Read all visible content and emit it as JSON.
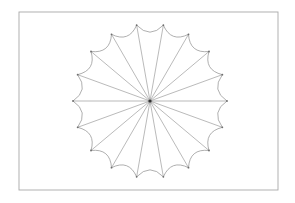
{
  "figure": {
    "type": "scalloped-radial-star",
    "frame": {
      "x": 19,
      "y": 12,
      "width": 259,
      "height": 178,
      "stroke": "#a8a8a8"
    },
    "center": {
      "x": 150,
      "y": 101
    },
    "radius": 77,
    "point_count": 18,
    "start_angle_deg": 0,
    "scallop_direction": "inward",
    "scallop_depth": 7,
    "colors": {
      "stroke": "#8c8c8c",
      "vertex": "#6e6e6e",
      "hub": "#333333",
      "background": "#ffffff"
    }
  }
}
